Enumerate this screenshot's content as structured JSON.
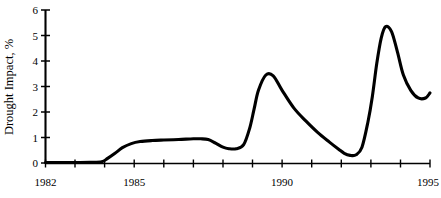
{
  "chart_data": {
    "type": "line",
    "title": "",
    "subtitle": "",
    "xlabel": "",
    "ylabel": "Drought Impact, %",
    "xlim": [
      1982,
      1995
    ],
    "ylim": [
      0,
      6
    ],
    "grid": false,
    "legend": null,
    "legend_position": "none",
    "line_color": "#000000",
    "background_color": "#ffffff",
    "x_tick_values": [
      1982,
      1983,
      1984,
      1985,
      1986,
      1987,
      1988,
      1989,
      1990,
      1991,
      1992,
      1993,
      1994,
      1995
    ],
    "x_tick_labels": [
      "1982",
      "",
      "",
      "1985",
      "",
      "",
      "",
      "",
      "1990",
      "",
      "",
      "",
      "",
      "1995"
    ],
    "x_labeled_ticks": [
      {
        "value": 1982,
        "label": "1982"
      },
      {
        "value": 1985,
        "label": "1985"
      },
      {
        "value": 1990,
        "label": "1990"
      },
      {
        "value": 1995,
        "label": "1995"
      }
    ],
    "y_tick_values": [
      0,
      1,
      2,
      3,
      4,
      5,
      6
    ],
    "y_tick_labels": [
      "0",
      "1",
      "2",
      "3",
      "4",
      "5",
      "6"
    ],
    "series": [
      {
        "name": "Drought Impact",
        "x": [
          1982.0,
          1982.5,
          1983.0,
          1983.5,
          1983.9,
          1984.1,
          1984.35,
          1984.6,
          1984.9,
          1985.2,
          1985.6,
          1986.0,
          1986.5,
          1987.0,
          1987.25,
          1987.5,
          1987.75,
          1988.0,
          1988.2,
          1988.45,
          1988.7,
          1988.9,
          1989.05,
          1989.2,
          1989.45,
          1989.7,
          1990.0,
          1990.4,
          1990.8,
          1991.2,
          1991.6,
          1991.9,
          1992.1,
          1992.3,
          1992.5,
          1992.7,
          1992.9,
          1993.05,
          1993.2,
          1993.35,
          1993.5,
          1993.7,
          1993.9,
          1994.1,
          1994.35,
          1994.6,
          1994.85,
          1995.0
        ],
        "y": [
          0.02,
          0.02,
          0.02,
          0.03,
          0.05,
          0.18,
          0.38,
          0.6,
          0.76,
          0.84,
          0.88,
          0.9,
          0.92,
          0.95,
          0.95,
          0.92,
          0.78,
          0.62,
          0.56,
          0.56,
          0.72,
          1.35,
          2.1,
          2.85,
          3.45,
          3.42,
          2.85,
          2.15,
          1.65,
          1.2,
          0.82,
          0.55,
          0.38,
          0.3,
          0.32,
          0.62,
          1.6,
          2.6,
          3.9,
          4.9,
          5.35,
          5.15,
          4.35,
          3.45,
          2.85,
          2.55,
          2.55,
          2.75
        ]
      }
    ],
    "annotations": []
  },
  "axes": {
    "y_axis_title": "Drought Impact, %",
    "x_axis_start_label": "1982",
    "x_axis_end_label": "1995"
  }
}
